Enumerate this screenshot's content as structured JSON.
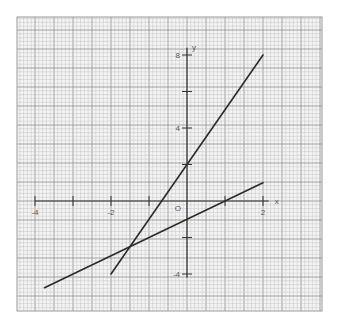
{
  "chart_data": {
    "type": "line",
    "title": "",
    "xlabel": "x",
    "ylabel": "y",
    "origin_label": "O",
    "xlim": [
      -4.5,
      3.5
    ],
    "ylim": [
      -5.7,
      9.8
    ],
    "grid": true,
    "x_ticks": [
      -4,
      -3,
      -2,
      -1,
      0,
      1,
      2
    ],
    "x_tick_labels": [
      {
        "value": -4,
        "text": "-4"
      },
      {
        "value": -2,
        "text": "-2"
      },
      {
        "value": 2,
        "text": "2"
      }
    ],
    "y_ticks": [
      -4,
      -2,
      0,
      2,
      4,
      6,
      8
    ],
    "y_tick_labels": [
      {
        "value": 8,
        "text": "8"
      },
      {
        "value": 4,
        "text": "4"
      },
      {
        "value": -4,
        "text": "-4"
      }
    ],
    "series": [
      {
        "name": "y = 3x + 2",
        "x": [
          -2,
          2
        ],
        "y": [
          -4,
          8
        ]
      },
      {
        "name": "y = x - 1",
        "x": [
          -3.75,
          2
        ],
        "y": [
          -4.75,
          1
        ]
      }
    ],
    "intersection": {
      "x": -1.5,
      "y": -2.5
    },
    "colors": {
      "line": "#2b2b2b",
      "axis": "#333333",
      "grid_minor": "#c4c4c4",
      "grid_major": "#8f8f8f"
    }
  }
}
